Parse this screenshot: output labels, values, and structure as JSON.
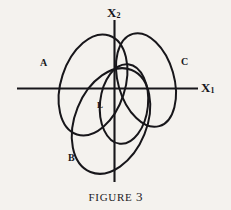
{
  "figure": {
    "caption_prefix": "FIGURE",
    "caption_number": "3",
    "background_color": "#f4f2ee",
    "ink_color": "#17161a",
    "width": 231,
    "height": 210
  },
  "axes": {
    "x_axis": {
      "label": "X",
      "subscript": "1",
      "orientation": "horizontal",
      "x_start": 17,
      "x_end": 198,
      "y": 88
    },
    "y_axis": {
      "label": "X",
      "subscript": "2",
      "orientation": "vertical",
      "y_start": 20,
      "y_end": 182,
      "x": 114
    },
    "origin": {
      "x": 114,
      "y": 88
    }
  },
  "curves": [
    {
      "id": "A",
      "label": "A",
      "label_x": 40,
      "label_y": 58,
      "shape": "ellipse",
      "cx": 93,
      "cy": 85,
      "rx": 32,
      "ry": 52,
      "rotation_deg": 18,
      "stroke_width": 2.0
    },
    {
      "id": "C",
      "label": "C",
      "label_x": 181,
      "label_y": 57,
      "shape": "ellipse",
      "cx": 146,
      "cy": 80,
      "rx": 28,
      "ry": 48,
      "rotation_deg": -16,
      "stroke_width": 2.0
    },
    {
      "id": "B",
      "label": "B",
      "label_x": 68,
      "label_y": 153,
      "shape": "ellipse",
      "cx": 111,
      "cy": 121,
      "rx": 36,
      "ry": 55,
      "rotation_deg": 22,
      "stroke_width": 2.0
    },
    {
      "id": "L",
      "label": "L",
      "label_x": 97,
      "label_y": 101,
      "shape": "ellipse",
      "cx": 124,
      "cy": 104,
      "rx": 24,
      "ry": 40,
      "rotation_deg": 6,
      "stroke_width": 2.0
    }
  ]
}
